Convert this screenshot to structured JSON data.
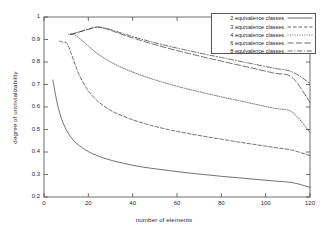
{
  "chart_data": {
    "type": "line",
    "title": "",
    "xlabel": "number of elements",
    "ylabel": "degree of untrivializability",
    "xlim": [
      0,
      120
    ],
    "ylim": [
      0.2,
      1
    ],
    "xticks": [
      "0",
      "20",
      "40",
      "60",
      "80",
      "100",
      "120"
    ],
    "xtick_values": [
      0,
      20,
      40,
      60,
      80,
      100,
      120
    ],
    "yticks": [
      "0.2",
      "0.3",
      "0.4",
      "0.5",
      "0.6",
      "0.7",
      "0.8",
      "0.9",
      "1"
    ],
    "ytick_values": [
      0.2,
      0.3,
      0.4,
      0.5,
      0.6,
      0.7,
      0.8,
      0.9,
      1
    ],
    "grid": false,
    "legend_position": "top-right",
    "series": [
      {
        "name": "2 equivalence classes",
        "dash": "solid",
        "x": [
          4,
          6,
          8,
          10,
          12,
          14,
          16,
          20,
          24,
          28,
          32,
          40,
          48,
          56,
          64,
          72,
          80,
          88,
          96,
          104,
          112,
          120
        ],
        "y": [
          0.72,
          0.615,
          0.545,
          0.5,
          0.468,
          0.445,
          0.428,
          0.402,
          0.384,
          0.37,
          0.359,
          0.341,
          0.328,
          0.318,
          0.308,
          0.3,
          0.292,
          0.285,
          0.278,
          0.271,
          0.264,
          0.243
        ]
      },
      {
        "name": "3 equivalence classes",
        "dash": "dashed",
        "x": [
          7,
          8,
          9,
          10,
          11,
          12,
          13,
          14,
          16,
          20,
          24,
          28,
          32,
          40,
          48,
          56,
          64,
          72,
          80,
          88,
          96,
          104,
          112,
          120
        ],
        "y": [
          0.893,
          0.889,
          0.888,
          0.886,
          0.87,
          0.845,
          0.818,
          0.79,
          0.74,
          0.672,
          0.628,
          0.598,
          0.575,
          0.543,
          0.519,
          0.5,
          0.484,
          0.47,
          0.457,
          0.444,
          0.432,
          0.42,
          0.408,
          0.384
        ]
      },
      {
        "name": "4 equivalence classes",
        "dash": "dotted",
        "x": [
          11,
          12,
          14,
          16,
          18,
          20,
          24,
          28,
          32,
          40,
          48,
          56,
          64,
          72,
          80,
          88,
          96,
          104,
          112,
          120
        ],
        "y": [
          0.924,
          0.925,
          0.92,
          0.905,
          0.888,
          0.87,
          0.838,
          0.812,
          0.79,
          0.755,
          0.727,
          0.703,
          0.682,
          0.663,
          0.645,
          0.628,
          0.611,
          0.594,
          0.577,
          0.487
        ]
      },
      {
        "name": "6 equivalence classes",
        "dash": "longdash",
        "x": [
          12,
          14,
          16,
          18,
          20,
          22,
          24,
          26,
          28,
          32,
          36,
          40,
          48,
          56,
          64,
          72,
          80,
          88,
          96,
          104,
          112,
          120
        ],
        "y": [
          0.922,
          0.928,
          0.934,
          0.94,
          0.945,
          0.951,
          0.955,
          0.952,
          0.947,
          0.934,
          0.92,
          0.907,
          0.883,
          0.861,
          0.841,
          0.822,
          0.804,
          0.786,
          0.768,
          0.75,
          0.731,
          0.62
        ]
      },
      {
        "name": "8 equivalence classes",
        "dash": "dashdot",
        "x": [
          12,
          14,
          16,
          18,
          20,
          22,
          24,
          26,
          28,
          32,
          36,
          40,
          48,
          56,
          64,
          72,
          80,
          88,
          96,
          104,
          112,
          120
        ],
        "y": [
          0.922,
          0.928,
          0.934,
          0.94,
          0.946,
          0.952,
          0.956,
          0.954,
          0.95,
          0.938,
          0.925,
          0.913,
          0.891,
          0.871,
          0.853,
          0.836,
          0.82,
          0.804,
          0.788,
          0.772,
          0.756,
          0.705
        ]
      }
    ]
  },
  "legend": {
    "entries": [
      {
        "label": "2 equivalence classes"
      },
      {
        "label": "3 equivalence classes"
      },
      {
        "label": "4 equivalence classes"
      },
      {
        "label": "6 equivalence classes"
      },
      {
        "label": "8 equivalence classes"
      }
    ]
  },
  "colors": {
    "line": "#404040",
    "axis": "#4a4a4a",
    "text": "#2a2a2a",
    "background": "#ffffff"
  }
}
